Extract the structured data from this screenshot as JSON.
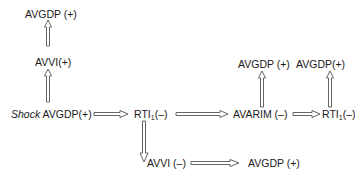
{
  "diagram": {
    "nodes": {
      "top_avgdp": "AVGDP (+)",
      "avvi_pos": "AVVI(+)",
      "shock_prefix": "Shock",
      "shock_avgdp": "AVGDP(+)",
      "rti_1_main": "RTI",
      "rti_1_sub": "1",
      "rti_1_sign": "(–)",
      "avarim": "AVARIM (–)",
      "rti_2_main": "RTI",
      "rti_2_sub": "1",
      "rti_2_sign": "(–)",
      "avarim_up_avgdp": "AVGDP (+)",
      "rti2_up_avgdp": "AVGDP(+)",
      "avvi_neg": "AVVI (–)",
      "bottom_avgdp": "AVGDP (+)"
    },
    "edges": [
      {
        "from": "shock_avgdp",
        "to": "avvi_pos",
        "direction": "up"
      },
      {
        "from": "avvi_pos",
        "to": "top_avgdp",
        "direction": "up"
      },
      {
        "from": "shock_avgdp",
        "to": "rti_1",
        "direction": "right"
      },
      {
        "from": "rti_1",
        "to": "avarim",
        "direction": "right"
      },
      {
        "from": "avarim",
        "to": "rti_2",
        "direction": "right"
      },
      {
        "from": "avarim",
        "to": "avarim_up_avgdp",
        "direction": "up"
      },
      {
        "from": "rti_2",
        "to": "rti2_up_avgdp",
        "direction": "up"
      },
      {
        "from": "rti_1",
        "to": "avvi_neg",
        "direction": "down"
      },
      {
        "from": "avvi_neg",
        "to": "bottom_avgdp",
        "direction": "right"
      }
    ]
  }
}
